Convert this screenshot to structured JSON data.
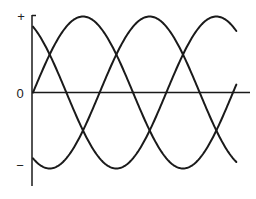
{
  "chart_data": {
    "type": "line",
    "title": "",
    "xlabel": "",
    "ylabel": "",
    "y_tick_labels": [
      "+",
      "0",
      "−"
    ],
    "grid": false,
    "legend": null,
    "x_range_degrees": [
      0,
      366
    ],
    "ylim": [
      -1,
      1
    ],
    "series": [
      {
        "name": "phase-a",
        "function": "sin(theta)",
        "phase_deg": 0,
        "amplitude": 1
      },
      {
        "name": "phase-b",
        "function": "sin(theta + 120)",
        "phase_deg": 120,
        "amplitude": 1
      },
      {
        "name": "phase-c",
        "function": "sin(theta - 120)",
        "phase_deg": -120,
        "amplitude": 1
      }
    ]
  },
  "labels": {
    "plus": "+",
    "zero": "0",
    "minus": "−"
  },
  "colors": {
    "stroke": "#1a1a1a",
    "background": "#ffffff"
  }
}
